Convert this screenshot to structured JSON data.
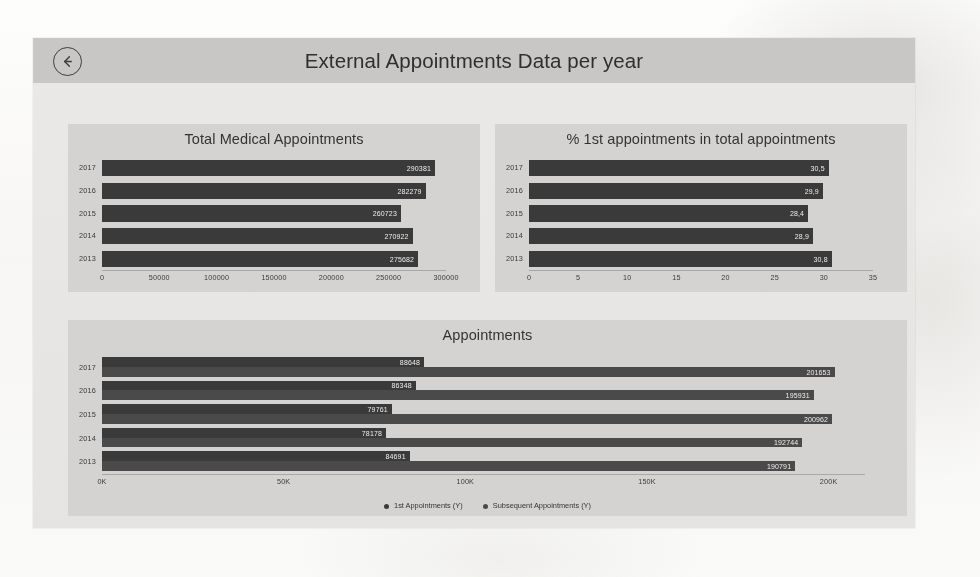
{
  "header": {
    "title": "External Appointments Data per year",
    "back_icon": "back-arrow-circle-icon"
  },
  "ghost_caption": "",
  "legend": {
    "series1": "1st Appointments (Y)",
    "series2": "Subsequent Appointments (Y)"
  },
  "colors": {
    "sheet_bg": "#e8e7e5",
    "topbar_bg": "#c9c8c6",
    "panel_bg": "#d5d4d2",
    "bar_primary": "#3a3a3a",
    "bar_secondary": "#4a4a4a",
    "label_text": "#efefef"
  },
  "chart_data": [
    {
      "type": "bar",
      "orientation": "horizontal",
      "title": "Total Medical Appointments",
      "categories": [
        "2017",
        "2016",
        "2015",
        "2014",
        "2013"
      ],
      "values": [
        290381,
        282279,
        260723,
        270922,
        275682
      ],
      "xlabel": "",
      "ylabel": "",
      "xlim": [
        0,
        300000
      ],
      "xticks": [
        "0",
        "50000",
        "100000",
        "150000",
        "200000",
        "250000",
        "300000"
      ],
      "xtick_values": [
        0,
        50000,
        100000,
        150000,
        200000,
        250000,
        300000
      ],
      "grid": false,
      "data_labels": [
        "290381",
        "282279",
        "260723",
        "270922",
        "275682"
      ]
    },
    {
      "type": "bar",
      "orientation": "horizontal",
      "title": "% 1st appointments in total appointments",
      "categories": [
        "2017",
        "2016",
        "2015",
        "2014",
        "2013"
      ],
      "values": [
        30.5,
        29.9,
        28.4,
        28.9,
        30.8
      ],
      "xlabel": "",
      "ylabel": "",
      "xlim": [
        0,
        35
      ],
      "xticks": [
        "0",
        "5",
        "10",
        "15",
        "20",
        "25",
        "30",
        "35"
      ],
      "xtick_values": [
        0,
        5,
        10,
        15,
        20,
        25,
        30,
        35
      ],
      "grid": false,
      "data_labels": [
        "30,5",
        "29,9",
        "28,4",
        "28,9",
        "30,8"
      ]
    },
    {
      "type": "bar",
      "orientation": "horizontal",
      "grouped": true,
      "title": "Appointments",
      "categories": [
        "2017",
        "2016",
        "2015",
        "2014",
        "2013"
      ],
      "series": [
        {
          "name": "1st Appointments (Y)",
          "values": [
            88648,
            86348,
            79761,
            78178,
            84691
          ]
        },
        {
          "name": "Subsequent Appointments (Y)",
          "values": [
            201653,
            195931,
            200962,
            192744,
            190791
          ]
        }
      ],
      "xlabel": "",
      "ylabel": "",
      "xlim": [
        0,
        210000
      ],
      "xticks": [
        "0K",
        "50K",
        "100K",
        "150K",
        "200K"
      ],
      "xtick_values": [
        0,
        50000,
        100000,
        150000,
        200000
      ],
      "grid": false,
      "legend_position": "bottom"
    }
  ]
}
